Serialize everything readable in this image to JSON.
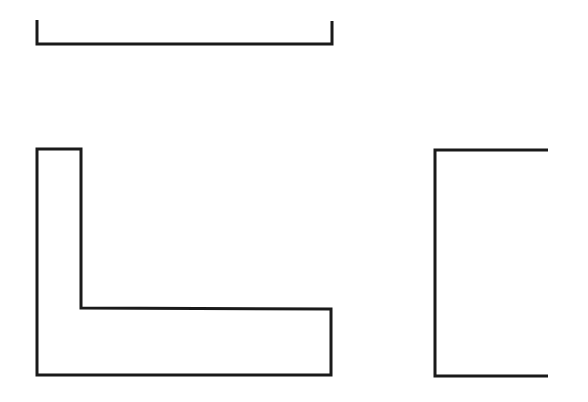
{
  "canvas": {
    "width": 588,
    "height": 402,
    "background": "#ffffff"
  },
  "style": {
    "stroke_color": "#1a1a1a",
    "stroke_width": 3
  },
  "shapes": [
    {
      "id": "top-bracket",
      "kind": "open-path",
      "description": "U-shaped tray / shallow bracket",
      "points": "37,20 37,44 332,44 332,21"
    },
    {
      "id": "l-shape",
      "kind": "closed-path",
      "description": "L-shaped outline",
      "points": "37,149 81,149 81,308 331,309 331,375 37,375"
    },
    {
      "id": "right-bracket",
      "kind": "open-path",
      "description": "Left-facing bracket open to the right",
      "points": "548,150 435,150 435,376 548,376"
    }
  ]
}
